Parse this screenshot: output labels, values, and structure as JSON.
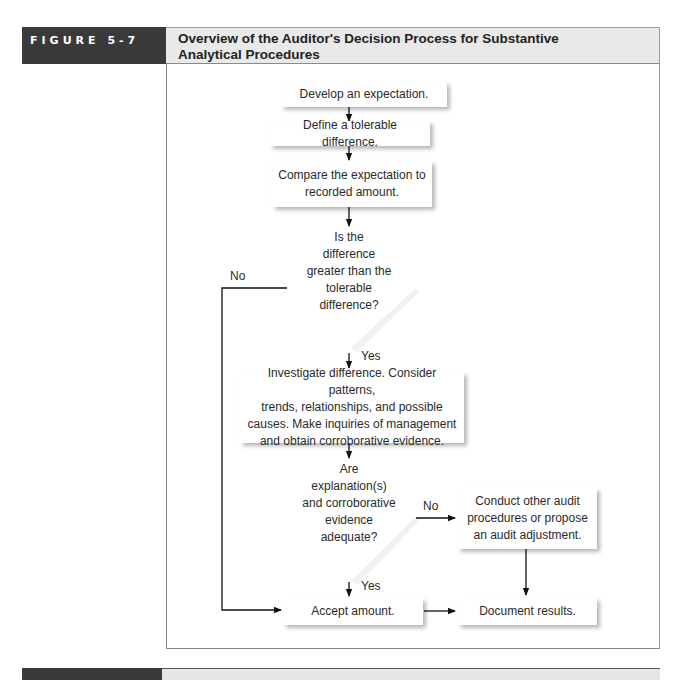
{
  "figure": {
    "label": "FIGURE 5-7",
    "title_line1": "Overview of the Auditor's Decision Process for Substantive",
    "title_line2": "Analytical Procedures"
  },
  "flowchart": {
    "steps": {
      "develop": "Develop an expectation.",
      "define": "Define a tolerable difference.",
      "compare_line1": "Compare the expectation to",
      "compare_line2": "recorded amount.",
      "investigate_line1": "Investigate difference. Consider patterns,",
      "investigate_line2": "trends, relationships, and possible",
      "investigate_line3": "causes. Make inquiries of management",
      "investigate_line4": "and obtain corroborative evidence.",
      "conduct_line1": "Conduct other audit",
      "conduct_line2": "procedures or propose",
      "conduct_line3": "an audit adjustment.",
      "accept": "Accept amount.",
      "document": "Document results."
    },
    "decisions": {
      "difference": [
        "Is the",
        "difference",
        "greater than the",
        "tolerable",
        "difference?"
      ],
      "adequate": [
        "Are",
        "explanation(s)",
        "and corroborative",
        "evidence",
        "adequate?"
      ]
    },
    "labels": {
      "no1": "No",
      "yes1": "Yes",
      "no2": "No",
      "yes2": "Yes"
    }
  }
}
